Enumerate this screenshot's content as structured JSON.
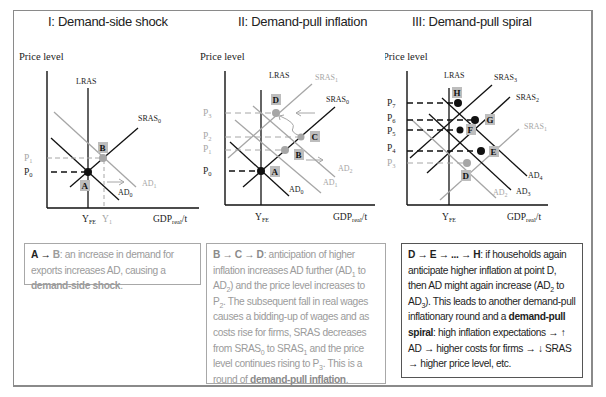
{
  "colors": {
    "dark": "#111111",
    "light": "#a6a6a6",
    "label_bg": "#bdbdbd",
    "frame": "#8a8a8a"
  },
  "panels": [
    {
      "title": "I: Demand-side shock",
      "y_axis_label": "Price level",
      "x_axis_label": "GDP",
      "x_axis_sub": "real",
      "x_axis_suffix": "/t",
      "curves": {
        "lras": "LRAS",
        "sras0": "SRAS",
        "sras0_sub": "0",
        "ad0": "AD",
        "ad0_sub": "0",
        "ad1": "AD",
        "ad1_sub": "1"
      },
      "price_labels": [
        {
          "p": "P",
          "sub": "1",
          "light": true
        },
        {
          "p": "P",
          "sub": "0",
          "light": false
        }
      ],
      "x_ticks": [
        {
          "t": "Y",
          "sub": "FE",
          "light": false
        },
        {
          "t": "Y",
          "sub": "1",
          "light": true
        }
      ],
      "points": [
        {
          "id": "A",
          "label": "A"
        },
        {
          "id": "B",
          "label": "B"
        }
      ],
      "caption": {
        "lead_a": "A",
        "arrow": "→",
        "lead_b": "B",
        "text": ": an increase in demand for exports increases AD, causing a ",
        "bold": "demand-side shock",
        "end": "."
      }
    },
    {
      "title": "II: Demand-pull inflation",
      "y_axis_label": "Price level",
      "x_axis_label": "GDP",
      "x_axis_sub": "real",
      "x_axis_suffix": "/t",
      "curves": {
        "lras": "LRAS",
        "sras1": "SRAS",
        "sras1_sub": "1",
        "sras0": "SRAS",
        "sras0_sub": "0",
        "ad0": "AD",
        "ad0_sub": "0",
        "ad1": "AD",
        "ad1_sub": "1",
        "ad2": "AD",
        "ad2_sub": "2"
      },
      "price_labels": [
        {
          "p": "P",
          "sub": "3",
          "light": true
        },
        {
          "p": "P",
          "sub": "2",
          "light": true
        },
        {
          "p": "P",
          "sub": "1",
          "light": true
        },
        {
          "p": "P",
          "sub": "0",
          "light": false
        }
      ],
      "x_ticks": [
        {
          "t": "Y",
          "sub": "FE",
          "light": false
        }
      ],
      "points": [
        {
          "id": "A",
          "label": "A"
        },
        {
          "id": "B",
          "label": "B"
        },
        {
          "id": "C",
          "label": "C"
        },
        {
          "id": "D",
          "label": "D"
        }
      ],
      "caption": {
        "lead": "B → C → D",
        "text1": ": anticipation of higher inflation increases AD further (AD",
        "s1": "1",
        "text2": " to AD",
        "s2": "2",
        "text3": ") and the price level increases to P",
        "s3": "2",
        "text4": ". The subsequent fall in real wages causes a bidding-up of wages and as costs rise for firms, SRAS decreases from SRAS",
        "s4": "0",
        "text5": " to SRAS",
        "s5": "1",
        "text6": " and the price level continues rising to P",
        "s6": "3",
        "text7": ". This is a round of ",
        "bold": "demand-pull inflation",
        "end": "."
      }
    },
    {
      "title": "III: Demand-pull spiral",
      "y_axis_label": "Price level",
      "x_axis_label": "GDP",
      "x_axis_sub": "real",
      "x_axis_suffix": "/t",
      "curves": {
        "lras": "LRAS",
        "sras3": "SRAS",
        "sras3_sub": "3",
        "sras2": "SRAS",
        "sras2_sub": "2",
        "sras1": "SRAS",
        "sras1_sub": "1",
        "ad4": "AD",
        "ad4_sub": "4",
        "ad3": "AD",
        "ad3_sub": "3",
        "ad2": "AD",
        "ad2_sub": "2"
      },
      "price_labels": [
        {
          "p": "P",
          "sub": "7",
          "light": false
        },
        {
          "p": "P",
          "sub": "6",
          "light": false
        },
        {
          "p": "P",
          "sub": "5",
          "light": false
        },
        {
          "p": "P",
          "sub": "4",
          "light": false
        },
        {
          "p": "P",
          "sub": "3",
          "light": true
        }
      ],
      "x_ticks": [
        {
          "t": "Y",
          "sub": "FE",
          "light": false
        }
      ],
      "points": [
        {
          "id": "D",
          "label": "D"
        },
        {
          "id": "E",
          "label": "E"
        },
        {
          "id": "F",
          "label": "F"
        },
        {
          "id": "G",
          "label": "G"
        },
        {
          "id": "H",
          "label": "H"
        }
      ],
      "caption": {
        "lead": "D → E → ... → H",
        "text1": ": if households again anticipate higher inflation at point D, then AD might again increase (AD",
        "s1": "2",
        "text2": " to AD",
        "s2": "3",
        "text3": "). This leads to another demand-pull inflationary round and a ",
        "bold": "demand-pull spiral",
        "text4": ": high inflation expectations → ↑ AD → higher costs for firms → ↓ SRAS → higher price level, etc."
      }
    }
  ]
}
